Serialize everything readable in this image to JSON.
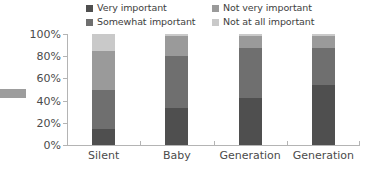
{
  "chart_data": {
    "type": "bar",
    "subtype": "stacked-100-percent",
    "title": "",
    "xlabel": "",
    "ylabel": "",
    "ylim": [
      0,
      100
    ],
    "ytick_labels": [
      "100%",
      "80%",
      "60%",
      "40%",
      "20%",
      "0%"
    ],
    "ytick_values": [
      100,
      80,
      60,
      40,
      20,
      0
    ],
    "grid": false,
    "legend_position": "top",
    "categories": [
      "Silent",
      "Baby",
      "Generation",
      "Generation"
    ],
    "series": [
      {
        "name": "Very important",
        "color": "#4f4f4f",
        "values": [
          14,
          33,
          42,
          54
        ]
      },
      {
        "name": "Somewhat important",
        "color": "#6f6f6f",
        "values": [
          36,
          47,
          45,
          33
        ]
      },
      {
        "name": "Not very important",
        "color": "#9a9a9a",
        "values": [
          35,
          18,
          11,
          11
        ]
      },
      {
        "name": "Not at all important",
        "color": "#c9c9c9",
        "values": [
          15,
          2,
          2,
          2
        ]
      }
    ],
    "cumulative_tops": [
      [
        14,
        50,
        85,
        100
      ],
      [
        33,
        80,
        98,
        100
      ],
      [
        42,
        87,
        98,
        100
      ],
      [
        54,
        87,
        98,
        100
      ]
    ]
  },
  "legend": {
    "items": [
      {
        "label": "Very important",
        "color": "#4f4f4f"
      },
      {
        "label": "Not very important",
        "color": "#9a9a9a"
      },
      {
        "label": "Somewhat important",
        "color": "#6f6f6f"
      },
      {
        "label": "Not at all important",
        "color": "#c9c9c9"
      }
    ]
  },
  "axis": {
    "y_labels": [
      "100%",
      "80%",
      "60%",
      "40%",
      "20%",
      "0%"
    ],
    "x_labels": [
      "Silent",
      "Baby",
      "Generation",
      "Generation"
    ]
  },
  "colors": {
    "very_important": "#4f4f4f",
    "somewhat_important": "#6f6f6f",
    "not_very_important": "#9a9a9a",
    "not_at_all_important": "#c9c9c9",
    "axis": "#b4b4b4",
    "text": "#4b4b4b",
    "edge_mark": "#9d9d9d"
  }
}
